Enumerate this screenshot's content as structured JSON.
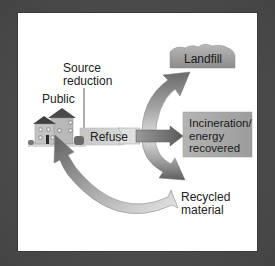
{
  "diagram": {
    "labels": {
      "source_reduction_line1": "Source",
      "source_reduction_line2": "reduction",
      "public": "Public",
      "refuse": "Refuse",
      "landfill": "Landfill",
      "incineration_line1": "Incineration/",
      "incineration_line2": "energy",
      "incineration_line3": "recovered",
      "recycled_line1": "Recycled",
      "recycled_line2": "material"
    },
    "nodes": [
      {
        "id": "public",
        "label": "Public",
        "icon": "house-icon"
      },
      {
        "id": "refuse",
        "label": "Refuse"
      },
      {
        "id": "landfill",
        "label": "Landfill"
      },
      {
        "id": "incineration",
        "label": "Incineration/ energy recovered"
      },
      {
        "id": "recycled",
        "label": "Recycled material"
      }
    ],
    "edges": [
      {
        "from": "public",
        "to": "refuse",
        "annotation": "Source reduction"
      },
      {
        "from": "refuse",
        "to": "landfill"
      },
      {
        "from": "refuse",
        "to": "incineration"
      },
      {
        "from": "refuse",
        "to": "recycled"
      },
      {
        "from": "recycled",
        "to": "public"
      }
    ],
    "colors": {
      "frame": "#4b4b4b",
      "panel": "#ffffff",
      "box_gray": "#a8a8a8",
      "arrow_dark": "#6e6e6e",
      "arrow_light": "#d8d8d8"
    }
  }
}
